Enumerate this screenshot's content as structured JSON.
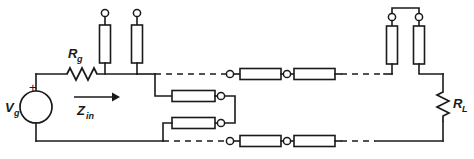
{
  "figure": {
    "name": "transmission-line-equivalent-circuit",
    "line_color": "#1a1a1a",
    "background_color": "#ffffff"
  },
  "labels": {
    "source_voltage": "V",
    "source_voltage_sub": "g",
    "source_resistance": "R",
    "source_resistance_sub": "g",
    "input_impedance": "Z",
    "input_impedance_sub": "in",
    "load_resistance": "R",
    "load_resistance_sub": "L",
    "plus_sign": "+",
    "minus_sign": "−"
  },
  "components": {
    "source": {
      "name": "voltage-source",
      "shape": "circle",
      "cx": 36,
      "cy": 107,
      "r": 16
    },
    "series_resistor": {
      "name": "series-resistor-Rg",
      "shape": "zigzag-horizontal",
      "x1": 67,
      "x2": 97,
      "y": 74
    },
    "load_resistor": {
      "name": "load-resistor-RL",
      "shape": "zigzag-vertical",
      "x": 443,
      "y1": 92,
      "y2": 122
    },
    "shunt_resistors_left": [
      {
        "name": "shunt-resistor-left-1",
        "x": 105,
        "y_top": 25,
        "y_bot": 63,
        "terminal_y": 15
      },
      {
        "name": "shunt-resistor-left-2",
        "x": 137,
        "y_top": 25,
        "y_bot": 63,
        "terminal_y": 15
      }
    ],
    "shunt_resistors_right": [
      {
        "name": "shunt-resistor-right-1",
        "x": 392,
        "y_top": 26,
        "y_bot": 64,
        "terminal_y": 16
      },
      {
        "name": "shunt-resistor-right-2",
        "x": 419,
        "y_top": 26,
        "y_bot": 64,
        "terminal_y": 16
      }
    ],
    "series_boxes_top": [
      {
        "name": "series-box-top-1",
        "x": 238,
        "y": 67,
        "w": 40,
        "h": 11
      },
      {
        "name": "series-box-top-2",
        "x": 292,
        "y": 67,
        "w": 40,
        "h": 11
      }
    ],
    "series_boxes_bottom": [
      {
        "name": "series-box-bottom-1",
        "x": 238,
        "y": 136,
        "w": 40,
        "h": 11
      },
      {
        "name": "series-box-bottom-2",
        "x": 292,
        "y": 136,
        "w": 40,
        "h": 11
      }
    ],
    "shunt_boxes_middle": [
      {
        "name": "shunt-box-middle-1",
        "x": 172,
        "y": 91,
        "w": 42,
        "h": 11
      },
      {
        "name": "shunt-box-middle-2",
        "x": 172,
        "y": 118,
        "w": 42,
        "h": 11
      }
    ],
    "terminals": [
      {
        "name": "terminal-top-left-1",
        "cx": 105,
        "cy": 13
      },
      {
        "name": "terminal-top-left-2",
        "cx": 137,
        "cy": 13
      },
      {
        "name": "terminal-top-right-1",
        "cx": 392,
        "cy": 17
      },
      {
        "name": "terminal-top-right-2",
        "cx": 419,
        "cy": 17
      },
      {
        "name": "terminal-series-top-1",
        "cx": 230,
        "cy": 72
      },
      {
        "name": "terminal-series-top-2",
        "cx": 285,
        "cy": 72
      },
      {
        "name": "terminal-series-bottom-1",
        "cx": 230,
        "cy": 141
      },
      {
        "name": "terminal-series-bottom-2",
        "cx": 285,
        "cy": 141
      },
      {
        "name": "terminal-shunt-middle-1",
        "cx": 221,
        "cy": 96
      },
      {
        "name": "terminal-shunt-middle-2",
        "cx": 221,
        "cy": 123
      }
    ],
    "arrow": {
      "name": "zin-direction-arrow",
      "x1": 74,
      "x2": 118,
      "y": 97
    }
  },
  "geometry": {
    "top_rail_y": 74,
    "bottom_rail_y": 141,
    "left_rail_x": 36,
    "right_rail_x": 443
  }
}
